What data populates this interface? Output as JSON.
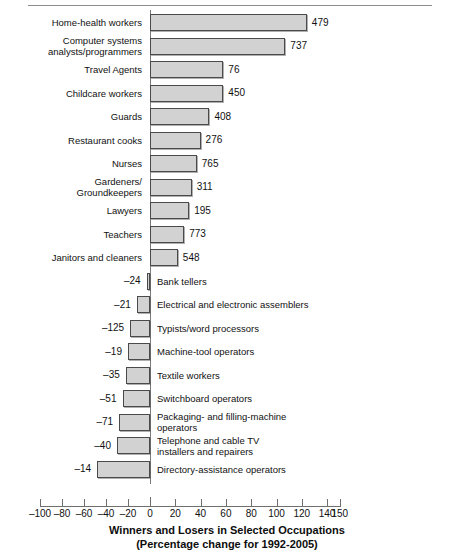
{
  "chart_data": {
    "type": "bar",
    "orientation": "horizontal",
    "title": "Winners and Losers in Selected Occupations",
    "subtitle": "(Percentage change for 1992-2005)",
    "xlabel": "",
    "ylabel": "",
    "xlim": [
      -100,
      150
    ],
    "grid": false,
    "legend": null,
    "xticks": [
      -100,
      -80,
      -60,
      -40,
      -20,
      0,
      20,
      40,
      60,
      80,
      100,
      120,
      140,
      150
    ],
    "xticklabels": [
      "–100",
      "–80",
      "–60",
      "–40",
      "–20",
      "0",
      "20",
      "40",
      "60",
      "80",
      "100",
      "120",
      "140",
      "150"
    ],
    "categories": [
      "Home-health  workers",
      "Computer systems\nanalysts/programmers",
      "Travel Agents",
      "Childcare workers",
      "Guards",
      "Restaurant cooks",
      "Nurses",
      "Gardeners/\nGroundkeepers",
      "Lawyers",
      "Teachers",
      "Janitors and cleaners",
      "Bank tellers",
      "Electrical and electronic assemblers",
      "Typists/word processors",
      "Machine-tool operators",
      "Textile workers",
      "Switchboard operators",
      "Packaging- and filling-machine\noperators",
      "Telephone  and cable TV\ninstallers and repairers",
      "Directory-assistance operators"
    ],
    "values": [
      124,
      107,
      58,
      58,
      47,
      40,
      37,
      33,
      31,
      27,
      22,
      -3,
      -12,
      -18,
      -20,
      -22,
      -25,
      -28,
      -30,
      -48
    ],
    "point_labels": [
      "479",
      "737",
      "76",
      "450",
      "408",
      "276",
      "765",
      "311",
      "195",
      "773",
      "548",
      "–24",
      "–21",
      "–125",
      "–19",
      "–35",
      "–51",
      "–71",
      "–40",
      "–14"
    ],
    "point_label_note": "numbers printed beside each bar (thousands of jobs added or lost)",
    "bar_fill": "#d2d2d2",
    "bar_stroke": "#4a4a4a"
  },
  "figure": {
    "rows": [
      {
        "label": "Home-health  workers",
        "value": 124,
        "point_label": "479",
        "side": "positive"
      },
      {
        "label": "Computer systems\nanalysts/programmers",
        "value": 107,
        "point_label": "737",
        "side": "positive"
      },
      {
        "label": "Travel Agents",
        "value": 58,
        "point_label": "76",
        "side": "positive"
      },
      {
        "label": "Childcare workers",
        "value": 58,
        "point_label": "450",
        "side": "positive"
      },
      {
        "label": "Guards",
        "value": 47,
        "point_label": "408",
        "side": "positive"
      },
      {
        "label": "Restaurant cooks",
        "value": 40,
        "point_label": "276",
        "side": "positive"
      },
      {
        "label": "Nurses",
        "value": 37,
        "point_label": "765",
        "side": "positive"
      },
      {
        "label": "Gardeners/\nGroundkeepers",
        "value": 33,
        "point_label": "311",
        "side": "positive"
      },
      {
        "label": "Lawyers",
        "value": 31,
        "point_label": "195",
        "side": "positive"
      },
      {
        "label": "Teachers",
        "value": 27,
        "point_label": "773",
        "side": "positive"
      },
      {
        "label": "Janitors and cleaners",
        "value": 22,
        "point_label": "548",
        "side": "positive"
      },
      {
        "label": "Bank tellers",
        "value": -3,
        "point_label": "–24",
        "side": "negative"
      },
      {
        "label": "Electrical and electronic assemblers",
        "value": -12,
        "point_label": "–21",
        "side": "negative"
      },
      {
        "label": "Typists/word processors",
        "value": -18,
        "point_label": "–125",
        "side": "negative"
      },
      {
        "label": "Machine-tool operators",
        "value": -20,
        "point_label": "–19",
        "side": "negative"
      },
      {
        "label": "Textile workers",
        "value": -22,
        "point_label": "–35",
        "side": "negative"
      },
      {
        "label": "Switchboard operators",
        "value": -25,
        "point_label": "–51",
        "side": "negative"
      },
      {
        "label": "Packaging- and filling-machine\noperators",
        "value": -28,
        "point_label": "–71",
        "side": "negative"
      },
      {
        "label": "Telephone  and cable TV\ninstallers and repairers",
        "value": -30,
        "point_label": "–40",
        "side": "negative"
      },
      {
        "label": "Directory-assistance operators",
        "value": -48,
        "point_label": "–14",
        "side": "negative"
      }
    ]
  }
}
